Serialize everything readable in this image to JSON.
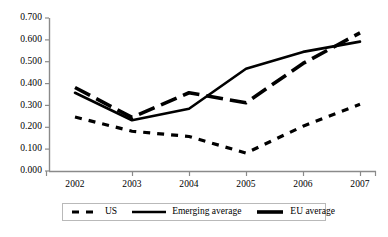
{
  "chart_data": {
    "type": "line",
    "title": "",
    "xlabel": "",
    "ylabel": "",
    "categories": [
      "2002",
      "2003",
      "2004",
      "2005",
      "2006",
      "2007"
    ],
    "x": [
      2002,
      2003,
      2004,
      2005,
      2006,
      2007
    ],
    "ylim": [
      0.0,
      0.7
    ],
    "ytick_step": 0.1,
    "yticks": [
      "0.000",
      "0.100",
      "0.200",
      "0.300",
      "0.400",
      "0.500",
      "0.600",
      "0.700"
    ],
    "ytick_values": [
      0.0,
      0.1,
      0.2,
      0.3,
      0.4,
      0.5,
      0.6,
      0.7
    ],
    "grid": false,
    "legend_position": "bottom",
    "series": [
      {
        "name": "US",
        "style": "dotted",
        "color": "#000000",
        "values": [
          0.247,
          0.182,
          0.158,
          0.082,
          0.205,
          0.305
        ]
      },
      {
        "name": "Emerging average",
        "style": "solid",
        "color": "#000000",
        "values": [
          0.358,
          0.232,
          0.285,
          0.468,
          0.545,
          0.592
        ]
      },
      {
        "name": "EU average",
        "style": "dashed",
        "color": "#000000",
        "values": [
          0.382,
          0.245,
          0.358,
          0.312,
          0.492,
          0.632
        ]
      }
    ]
  },
  "legend": {
    "items": [
      {
        "label": "US",
        "icon": "dotted-line-swatch"
      },
      {
        "label": "Emerging average",
        "icon": "solid-line-swatch"
      },
      {
        "label": "EU average",
        "icon": "dashed-line-swatch"
      }
    ]
  },
  "axes": {
    "axis_color": "#8a8a8a",
    "series_color": "#000000"
  }
}
